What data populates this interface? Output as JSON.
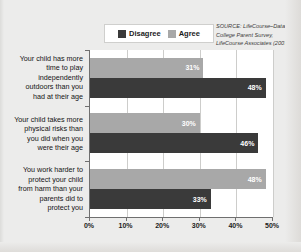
{
  "legend": {
    "entries": [
      {
        "label": "Disagree",
        "color": "#3a3a3a",
        "key": "disagree"
      },
      {
        "label": "Agree",
        "color": "#a8a8a8",
        "key": "agree"
      }
    ]
  },
  "source": {
    "line1": "SOURCE: LifeCourse–Datatel",
    "line2": "College Parent Survey,",
    "line3": "LifeCourse Associates (2007)"
  },
  "chart_data": {
    "type": "bar",
    "orientation": "horizontal",
    "title": "",
    "xlabel": "",
    "ylabel": "",
    "xlim": [
      0,
      50
    ],
    "xticks": [
      "0%",
      "10%",
      "20%",
      "30%",
      "40%",
      "50%"
    ],
    "grid": true,
    "legend_position": "top-center",
    "categories": [
      "Your child has more time to play independently outdoors than you had at their age",
      "Your child takes more physical risks than you did when you were their age",
      "You work harder to protect your child from harm than your parents did to protect you"
    ],
    "category_lines": [
      [
        "Your child has more",
        "time to play",
        "independently",
        "outdoors than you",
        "had at their age"
      ],
      [
        "Your child takes more",
        "physical risks than",
        "you did when you",
        "were their age"
      ],
      [
        "You work harder to",
        "protect your child",
        "from harm than your",
        "parents did to",
        "protect you"
      ]
    ],
    "series": [
      {
        "name": "Agree",
        "color": "#a8a8a8",
        "values": [
          31,
          30,
          48
        ],
        "labels": [
          "31%",
          "30%",
          "48%"
        ]
      },
      {
        "name": "Disagree",
        "color": "#3a3a3a",
        "values": [
          48,
          46,
          33
        ],
        "labels": [
          "48%",
          "46%",
          "33%"
        ]
      }
    ]
  }
}
